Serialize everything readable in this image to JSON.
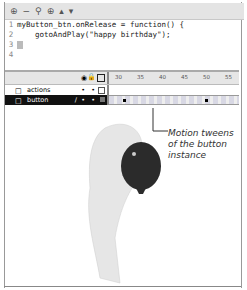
{
  "toolbar": {
    "icons": [
      "add-statement-icon",
      "delete-icon",
      "find-icon",
      "target-icon",
      "up-arrow-icon",
      "down-arrow-icon"
    ],
    "glyphs": [
      "⊕",
      "−",
      "⚲",
      "⊕",
      "▴",
      "▾"
    ]
  },
  "code": {
    "lines": [
      {
        "num": "1",
        "text": "myButton_btn.onRelease = function() {"
      },
      {
        "num": "2",
        "text": "    gotoAndPlay(\"happy birthday\");"
      },
      {
        "num": "3",
        "text": ""
      },
      {
        "num": "4",
        "text": ""
      }
    ]
  },
  "timeline": {
    "ruler": [
      "30",
      "35",
      "40",
      "45",
      "50",
      "55"
    ],
    "layers": [
      {
        "name": "actions",
        "selected": false
      },
      {
        "name": "button",
        "selected": true
      }
    ]
  },
  "callout": {
    "text_line1": "Motion tweens",
    "text_line2": "of the button",
    "text_line3": "instance"
  },
  "colors": {
    "selected_layer": "#111111",
    "toolbar_bg": "#e4e4e4",
    "balloon": "#2b2b2b"
  }
}
